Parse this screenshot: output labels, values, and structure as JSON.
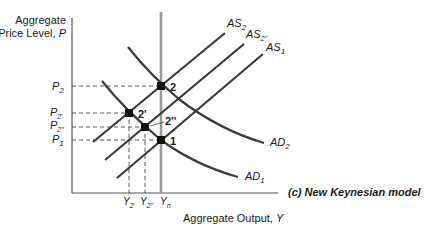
{
  "diagram": {
    "caption": "(c) New Keynesian model",
    "y_axis_label_line1": "Aggregate",
    "y_axis_label_line2": "Price Level, ",
    "y_axis_var": "P",
    "x_axis_label": "Aggregate Output, ",
    "x_axis_var": "Y",
    "price_levels": [
      {
        "base": "P",
        "sub": "2"
      },
      {
        "base": "P",
        "sub": "2'"
      },
      {
        "base": "P",
        "sub": "2''"
      },
      {
        "base": "P",
        "sub": "1"
      }
    ],
    "output_levels": [
      {
        "base": "Y",
        "sub": "2'"
      },
      {
        "base": "Y",
        "sub": "2''"
      },
      {
        "base": "Y",
        "sub": "n"
      }
    ],
    "curves": {
      "as2": {
        "base": "AS",
        "sub": "2"
      },
      "as2pp": {
        "base": "AS",
        "sub": "2''"
      },
      "as1": {
        "base": "AS",
        "sub": "1"
      },
      "ad2": {
        "base": "AD",
        "sub": "2"
      },
      "ad1": {
        "base": "AD",
        "sub": "1"
      }
    },
    "points": [
      "2",
      "2'",
      "2''",
      "1"
    ],
    "colors": {
      "curve": "#3a3a3a",
      "vertical_line": "#9a9a9a",
      "axis": "#555555",
      "dash": "#444444"
    }
  }
}
